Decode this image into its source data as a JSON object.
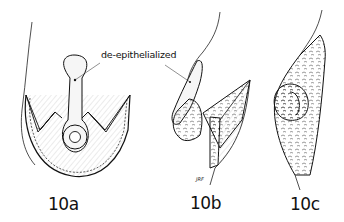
{
  "figure": {
    "callout_label": "de-epithelialized",
    "panels": [
      {
        "id": "10a",
        "label": "10a"
      },
      {
        "id": "10b",
        "label": "10b"
      },
      {
        "id": "10c",
        "label": "10c"
      }
    ],
    "artist_signature": "JRF",
    "colors": {
      "ink": "#111111",
      "background": "#ffffff",
      "flap_fill": "#f4f4f4"
    }
  }
}
